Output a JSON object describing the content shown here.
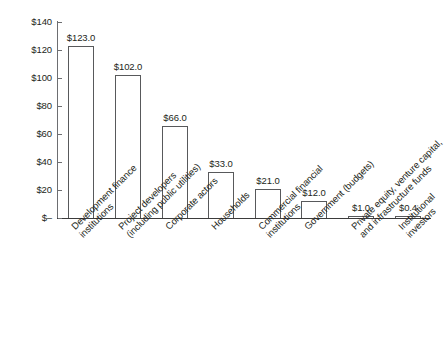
{
  "chart_data": {
    "type": "bar",
    "title": "",
    "subtitle": "",
    "xlabel": "",
    "ylabel": "",
    "ylim": [
      0,
      140
    ],
    "grid": false,
    "legend": "none",
    "y_ticks": [
      {
        "value": 140,
        "label": "$140"
      },
      {
        "value": 120,
        "label": "$120"
      },
      {
        "value": 100,
        "label": "$100"
      },
      {
        "value": 80,
        "label": "$80"
      },
      {
        "value": 60,
        "label": "$60"
      },
      {
        "value": 40,
        "label": "$40"
      },
      {
        "value": 20,
        "label": "$20"
      },
      {
        "value": 0,
        "label": "$–"
      }
    ],
    "categories": [
      "Development finance\ninstitutions",
      "Project developers\n(including public utilities)",
      "Corporate actors",
      "Households",
      "Commercial financial\ninstitutions",
      "Government (budgets)",
      "Private equity, venture capital,\nand infrastructure funds",
      "Institutional\ninvestors"
    ],
    "values": [
      123.0,
      102.0,
      66.0,
      33.0,
      21.0,
      12.0,
      1.0,
      0.4
    ],
    "data_labels": [
      "$123.0",
      "$102.0",
      "$66.0",
      "$33.0",
      "$21.0",
      "$12.0",
      "$1.0",
      "$0.4"
    ],
    "colors": {
      "bar_fill": "#ffffff",
      "bar_stroke": "#58595b",
      "axis": "#3b3b3b",
      "text": "#231f20",
      "background": "#ffffff"
    }
  }
}
